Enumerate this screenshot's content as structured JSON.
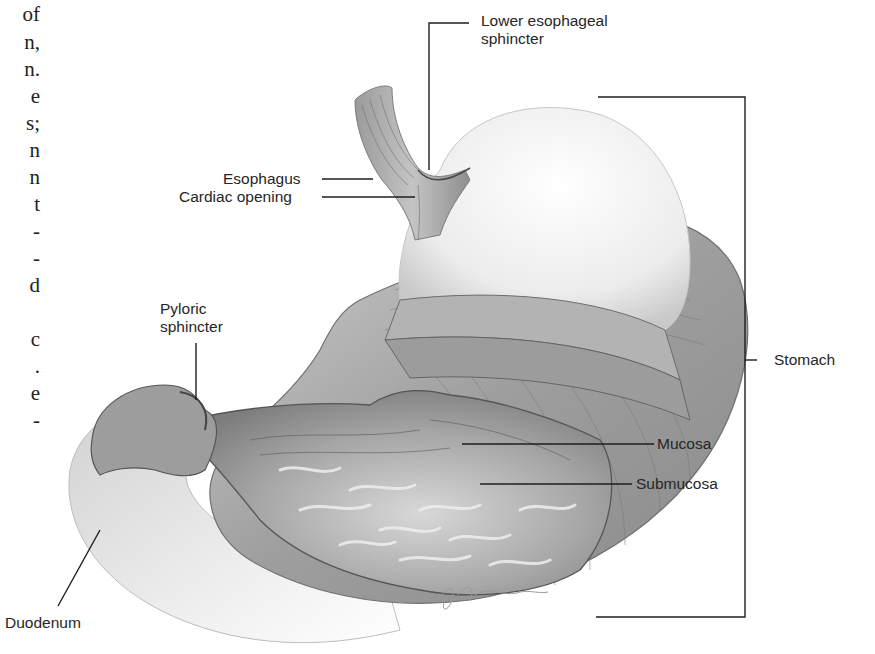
{
  "figure": {
    "left_margin_text_fragments": [
      "of",
      "n,",
      "n.",
      "e",
      "s;",
      "n",
      "n",
      "t",
      "-",
      "-",
      "d",
      "",
      "c",
      ".",
      "e",
      "-"
    ],
    "labels": {
      "lower_esophageal_sphincter": [
        "Lower esophageal",
        "sphincter"
      ],
      "esophagus": "Esophagus",
      "cardiac_opening": "Cardiac opening",
      "pyloric_sphincter": [
        "Pyloric",
        "sphincter"
      ],
      "stomach": "Stomach",
      "mucosa": "Mucosa",
      "submucosa": "Submucosa",
      "duodenum": "Duodenum"
    },
    "signature": "Geoff Brown"
  }
}
